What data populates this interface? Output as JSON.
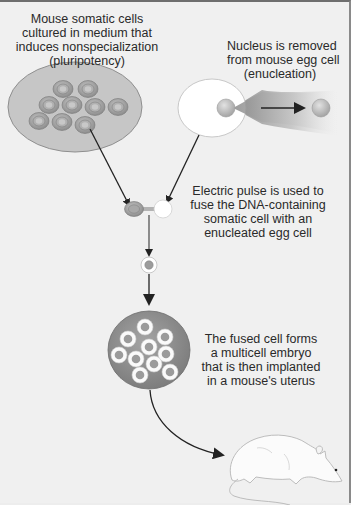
{
  "diagram": {
    "title": "",
    "steps": [
      {
        "id": "somatic-culture",
        "label": "Mouse somatic cells\ncultured in medium that\ninduces nonspecialization\n(pluripotency)"
      },
      {
        "id": "enucleation",
        "label": "Nucleus is removed\nfrom mouse egg cell\n(enucleation)"
      },
      {
        "id": "fusion",
        "label": "Electric pulse is used to\nfuse the DNA-containing\nsomatic cell with an\nenucleated egg cell"
      },
      {
        "id": "embryo",
        "label": "The fused cell forms\na multicell embryo\nthat is then implanted\nin a mouse's uterus"
      }
    ],
    "nodes": [
      {
        "id": "culture-dish",
        "shape": "ellipse",
        "contents": "9 somatic cells"
      },
      {
        "id": "egg-cell",
        "shape": "ellipse",
        "contents": "nucleus being removed"
      },
      {
        "id": "removed-nucleus",
        "shape": "circle"
      },
      {
        "id": "fusing-cells",
        "shape": "pair"
      },
      {
        "id": "fused-cell",
        "shape": "circle"
      },
      {
        "id": "embryo",
        "shape": "circle",
        "contents": "11 cells"
      },
      {
        "id": "mouse",
        "shape": "illustration"
      }
    ],
    "edges": [
      {
        "from": "culture-dish",
        "to": "fusing-cells"
      },
      {
        "from": "egg-cell",
        "to": "fusing-cells"
      },
      {
        "from": "removed-nucleus-origin",
        "to": "removed-nucleus"
      },
      {
        "from": "fusing-cells",
        "to": "fused-cell"
      },
      {
        "from": "fused-cell",
        "to": "embryo"
      },
      {
        "from": "embryo",
        "to": "mouse"
      }
    ],
    "colors": {
      "background": "#f0f0f0",
      "dish_fill": "#c4c4c4",
      "dish_stroke": "#8f8f8f",
      "cell_outer": "#9a9a9a",
      "cell_inner": "#b8b8b8",
      "egg_fill": "#ffffff",
      "embryo_fill": "#8e8e8e",
      "arrow": "#222222"
    }
  }
}
